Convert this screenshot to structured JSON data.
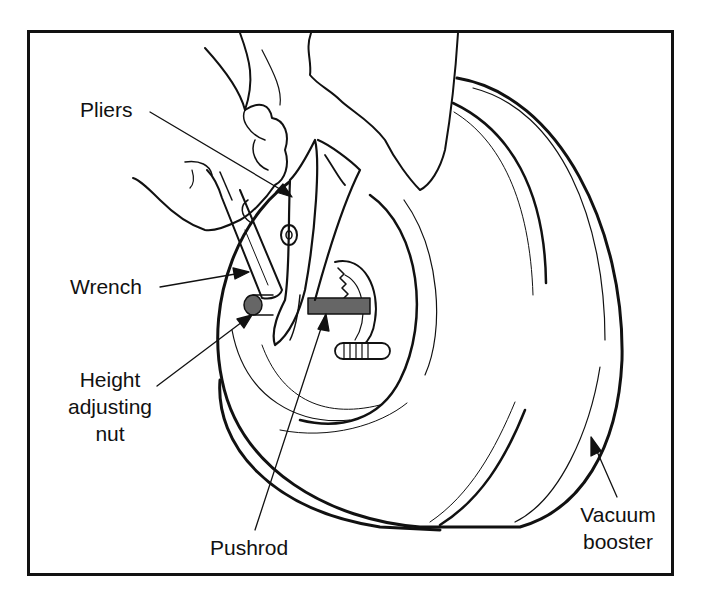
{
  "figure": {
    "labels": {
      "pliers": "Pliers",
      "wrench": "Wrench",
      "height_adjusting_nut": [
        "Height",
        "adjusting",
        "nut"
      ],
      "pushrod": "Pushrod",
      "vacuum_booster": [
        "Vacuum",
        "booster"
      ]
    },
    "colors": {
      "line": "#111111",
      "pushrod_fill": "#666666",
      "background": "#ffffff"
    }
  }
}
